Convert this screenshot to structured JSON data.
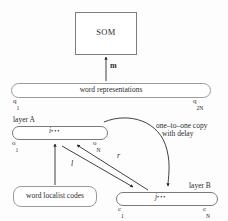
{
  "diagram": {
    "nodes": {
      "som": {
        "label": "SOM"
      },
      "word_representations": {
        "label": "word representations",
        "left_index": "q",
        "left_index_sub": "1",
        "right_index": "q",
        "right_index_sub": "2N"
      },
      "layer_a": {
        "title": "layer A",
        "middle_index": "i",
        "middle_dots": "•••",
        "left_unit_label": "o",
        "left_unit_sub": "1",
        "right_unit_label": "o",
        "right_unit_sub": "N"
      },
      "layer_b": {
        "title": "layer B",
        "middle_index": "j",
        "middle_dots": "•••",
        "left_unit_label": "c",
        "left_unit_sub": "1",
        "right_unit_label": "c",
        "right_unit_sub": "N"
      },
      "localist_codes": {
        "label": "word localist codes"
      }
    },
    "edges": {
      "som_arrow_label": "m",
      "a_to_b_label": "l",
      "b_to_a_label": "r",
      "copy_line_1": "one–to–one copy",
      "copy_line_2": "with delay"
    },
    "colors": {
      "stroke": "#2b2b2b",
      "box_stroke": "#7d7d7d",
      "pill_stroke": "#9a9a9a",
      "dot_fill": "#1c1c1c",
      "background": "#fdfdfd"
    }
  }
}
